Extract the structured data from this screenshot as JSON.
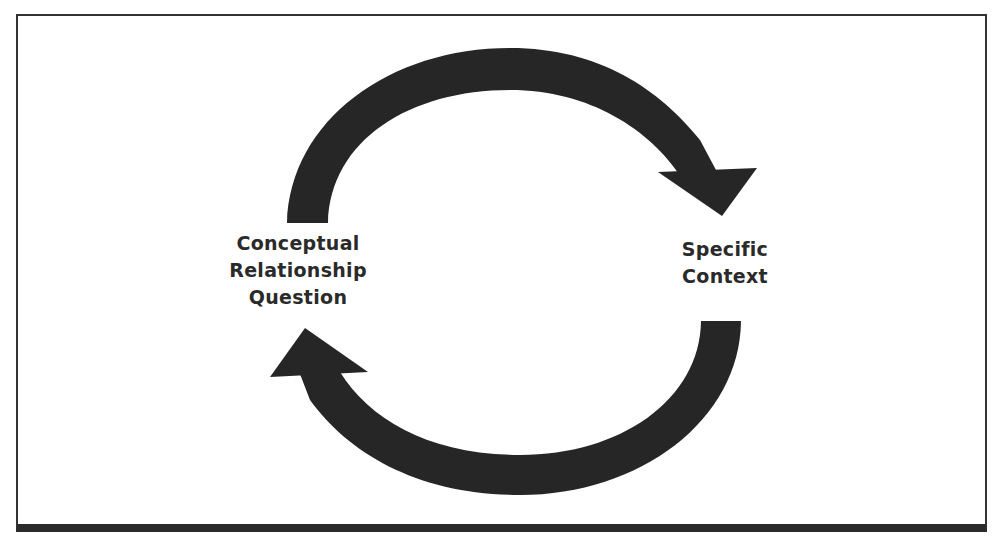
{
  "diagram": {
    "type": "cycle",
    "frame": {
      "border_color": "#333333",
      "bottom_bar_color": "#2b2b2b",
      "background": "#ffffff"
    },
    "arrow_color": "#262626",
    "nodes": [
      {
        "id": "left",
        "lines": [
          "Conceptual",
          "Relationship",
          "Question"
        ]
      },
      {
        "id": "right",
        "lines": [
          "Specific",
          "Context"
        ]
      }
    ],
    "edges": [
      {
        "from": "Conceptual Relationship Question",
        "to": "Specific Context",
        "path": "top arc, clockwise"
      },
      {
        "from": "Specific Context",
        "to": "Conceptual Relationship Question",
        "path": "bottom arc, clockwise"
      }
    ]
  }
}
